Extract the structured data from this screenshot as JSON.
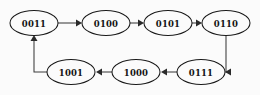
{
  "diagram": {
    "type": "directed-cycle-graph",
    "title": "",
    "background_color": "#fbfbfb",
    "node_fill": "#fbfbfb",
    "node_stroke": "#1a1a1a",
    "edge_color": "#3c3c3c",
    "label_color": "#141414",
    "nodes": [
      {
        "id": "n0",
        "label": "0011",
        "cx": 34,
        "cy": 23,
        "rx": 24,
        "ry": 12.5
      },
      {
        "id": "n1",
        "label": "0100",
        "cx": 106,
        "cy": 23,
        "rx": 24,
        "ry": 12.5
      },
      {
        "id": "n2",
        "label": "0101",
        "cx": 168,
        "cy": 23,
        "rx": 24,
        "ry": 12.5
      },
      {
        "id": "n3",
        "label": "0110",
        "cx": 226,
        "cy": 23,
        "rx": 24,
        "ry": 12.5
      },
      {
        "id": "n4",
        "label": "0111",
        "cx": 201,
        "cy": 72,
        "rx": 24,
        "ry": 12.5
      },
      {
        "id": "n5",
        "label": "1000",
        "cx": 136,
        "cy": 72,
        "rx": 24,
        "ry": 12.5
      },
      {
        "id": "n6",
        "label": "1001",
        "cx": 71,
        "cy": 72,
        "rx": 24,
        "ry": 12.5
      }
    ],
    "edges": [
      {
        "id": "e0",
        "from": "0011",
        "to": "0100",
        "direction": "right",
        "d": "M 58 23 L 78.5 23"
      },
      {
        "id": "e1",
        "from": "0100",
        "to": "0101",
        "direction": "right",
        "d": "M 130 23 L 140.5 23"
      },
      {
        "id": "e2",
        "from": "0101",
        "to": "0110",
        "direction": "right",
        "d": "M 192 23 L 198.5 23"
      },
      {
        "id": "e3",
        "from": "0110",
        "to": "0111",
        "direction": "down-left",
        "d": "M 226 35.5 L 226 72 L 228.5 72"
      },
      {
        "id": "e4",
        "from": "0111",
        "to": "1000",
        "direction": "left",
        "d": "M 177 72 L 164.5 72"
      },
      {
        "id": "e5",
        "from": "1000",
        "to": "1001",
        "direction": "left",
        "d": "M 112 72 L 99.5 72"
      },
      {
        "id": "e6",
        "from": "1001",
        "to": "0011",
        "direction": "left-up",
        "d": "M 47 72 L 34 72 L 34 39"
      }
    ],
    "arrowheads": [
      {
        "id": "a0",
        "target": "0100",
        "points": "76,19.5 76,26.5 82,23"
      },
      {
        "id": "a1",
        "target": "0101",
        "points": "138,19.5 138,26.5 144,23"
      },
      {
        "id": "a2",
        "target": "0110",
        "points": "196,19.5 196,26.5 202,23"
      },
      {
        "id": "a3",
        "target": "0111",
        "points": "231,68.5 231,75.5 225,72"
      },
      {
        "id": "a4",
        "target": "1000",
        "points": "167,68.5 167,75.5 161,72"
      },
      {
        "id": "a5",
        "target": "1001",
        "points": "102,68.5 102,75.5 96,72"
      },
      {
        "id": "a6",
        "target": "0011",
        "points": "30.5,41 37.5,41 34,35"
      }
    ]
  }
}
